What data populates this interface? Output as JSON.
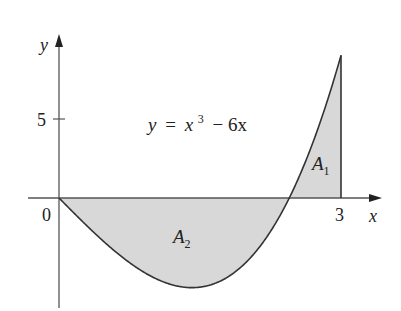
{
  "chart_data": {
    "type": "area",
    "title": "",
    "equation": "y = x³ − 6x",
    "equation_parts": {
      "lhs": "y",
      "eq": "=",
      "base": "x",
      "exp": "3",
      "rest": "− 6x"
    },
    "xlabel": "x",
    "ylabel": "y",
    "x_ticks": [
      {
        "value": 0,
        "label": "0"
      },
      {
        "value": 3,
        "label": "3"
      }
    ],
    "y_ticks": [
      {
        "value": 5,
        "label": "5"
      }
    ],
    "xlim": [
      -0.35,
      3.4
    ],
    "ylim": [
      -6.9,
      9.9
    ],
    "grid": false,
    "function": "x^3 - 6x",
    "x": [
      0,
      0.5,
      1,
      1.414,
      2,
      2.449,
      3
    ],
    "y": [
      0,
      -2.875,
      -5,
      -5.657,
      -4,
      0,
      9
    ],
    "regions": [
      {
        "name": "A",
        "sub": "1",
        "from": 2.449,
        "to": 3,
        "fill": "#d6d6d6"
      },
      {
        "name": "A",
        "sub": "2",
        "from": 0,
        "to": 2.449,
        "fill": "#d6d6d6"
      }
    ],
    "colors": {
      "curve": "#333333",
      "axis": "#555555",
      "fill": "#d6d6d6"
    }
  }
}
